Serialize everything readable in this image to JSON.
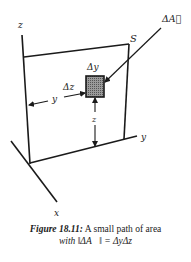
{
  "diagram": {
    "type": "3d-surface-area-element",
    "labels": {
      "z_axis": "z",
      "y_axis": "y",
      "x_axis": "x",
      "surface": "S",
      "area_vector": "ΔA⃗",
      "delta_y": "Δy",
      "delta_z": "Δz",
      "y_distance": "y",
      "z_distance": "z"
    },
    "colors": {
      "line": "#1a1a1a",
      "patch_fill": "#8a8a8a",
      "background": "#ffffff"
    }
  },
  "caption": {
    "figure_number": "Figure 18.11:",
    "line1_text": " A small path of area",
    "line2_text": "with ‖ΔA⃗‖ = ΔyΔz"
  }
}
